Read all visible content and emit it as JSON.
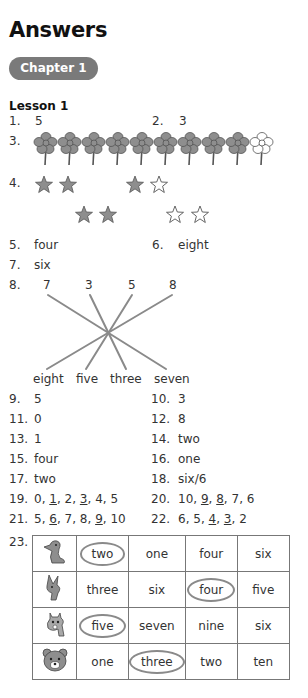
{
  "page": {
    "title": "Answers",
    "chapter_label": "Chapter 1",
    "lesson_label": "Lesson 1"
  },
  "colors": {
    "pill_bg": "#7a7a7a",
    "icon_fill": "#8e8e8e",
    "line": "#8a8a8a"
  },
  "answers": {
    "q1": {
      "num": "1.",
      "answer": "5"
    },
    "q2": {
      "num": "2.",
      "answer": "3"
    },
    "q3": {
      "num": "3.",
      "flowers_filled": 9,
      "flowers_empty": 1
    },
    "q4": {
      "num": "4.",
      "groups": [
        {
          "filled": 2,
          "empty": 0
        },
        {
          "filled": 1,
          "empty": 1
        },
        {
          "filled": 2,
          "empty": 0
        },
        {
          "filled": 0,
          "empty": 2
        }
      ]
    },
    "q5": {
      "num": "5.",
      "answer": "four"
    },
    "q6": {
      "num": "6.",
      "answer": "eight"
    },
    "q7": {
      "num": "7.",
      "answer": "six"
    },
    "q8": {
      "num": "8.",
      "top": [
        "7",
        "3",
        "5",
        "8"
      ],
      "bottom": [
        "eight",
        "five",
        "three",
        "seven"
      ],
      "matches": [
        [
          "7",
          "seven"
        ],
        [
          "3",
          "three"
        ],
        [
          "5",
          "five"
        ],
        [
          "8",
          "eight"
        ]
      ]
    },
    "q9": {
      "num": "9.",
      "answer": "5"
    },
    "q10": {
      "num": "10.",
      "answer": "3"
    },
    "q11": {
      "num": "11.",
      "answer": "0"
    },
    "q12": {
      "num": "12.",
      "answer": "8"
    },
    "q13": {
      "num": "13.",
      "answer": "1"
    },
    "q14": {
      "num": "14.",
      "answer": "two"
    },
    "q15": {
      "num": "15.",
      "answer": "four"
    },
    "q16": {
      "num": "16.",
      "answer": "one"
    },
    "q17": {
      "num": "17.",
      "answer": "two"
    },
    "q18": {
      "num": "18.",
      "answer": "six/6"
    },
    "q19": {
      "num": "19.",
      "seq": [
        "0",
        "1",
        "2",
        "3",
        "4",
        "5"
      ],
      "underlined": [
        "1",
        "3"
      ]
    },
    "q20": {
      "num": "20.",
      "seq": [
        "10",
        "9",
        "8",
        "7",
        "6"
      ],
      "underlined": [
        "9",
        "8"
      ]
    },
    "q21": {
      "num": "21.",
      "seq": [
        "5",
        "6",
        "7",
        "8",
        "9",
        "10"
      ],
      "underlined": [
        "6",
        "9"
      ]
    },
    "q22": {
      "num": "22.",
      "seq": [
        "6",
        "5",
        "4",
        "3",
        "2"
      ],
      "underlined": [
        "4",
        "3"
      ]
    },
    "q23": {
      "num": "23.",
      "rows": [
        {
          "animal": "duck-icon",
          "options": [
            "two",
            "one",
            "four",
            "six"
          ],
          "circled": "two"
        },
        {
          "animal": "kangaroo-icon",
          "options": [
            "three",
            "six",
            "four",
            "five"
          ],
          "circled": "four"
        },
        {
          "animal": "giraffe-icon",
          "options": [
            "five",
            "seven",
            "nine",
            "six"
          ],
          "circled": "five"
        },
        {
          "animal": "bear-icon",
          "options": [
            "one",
            "three",
            "two",
            "ten"
          ],
          "circled": "three"
        }
      ]
    }
  }
}
